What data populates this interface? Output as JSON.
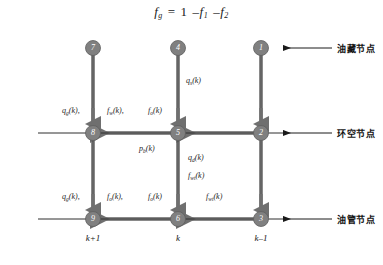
{
  "equation": {
    "lhs_base": "f",
    "lhs_sub": "g",
    "eq": "=",
    "one": "1",
    "minus1": "–",
    "t1_base": "f",
    "t1_sub": "1",
    "minus2": "–",
    "t2_base": "f",
    "t2_sub": "2",
    "full_text": "f_g = 1 – f_1 – f_2"
  },
  "colors": {
    "node_fill": "#808080",
    "node_stroke": "#5e5e5e",
    "node_text": "#ffffff",
    "pipe_thick": "#8a8a8a",
    "pipe_thin": "#3a3a3a",
    "annotation_arrow": "#1a1a1a",
    "text": "#1d1d1d",
    "background": "#ffffff"
  },
  "diagram": {
    "nodes": [
      {
        "id": "node-7",
        "label": "7",
        "x": 93,
        "y": 48,
        "row": "top",
        "col": "k+1"
      },
      {
        "id": "node-4",
        "label": "4",
        "x": 178,
        "y": 48,
        "row": "top",
        "col": "k"
      },
      {
        "id": "node-1",
        "label": "1",
        "x": 261,
        "y": 48,
        "row": "top",
        "col": "k-1"
      },
      {
        "id": "node-8",
        "label": "8",
        "x": 93,
        "y": 133,
        "row": "middle",
        "col": "k+1"
      },
      {
        "id": "node-5",
        "label": "5",
        "x": 178,
        "y": 133,
        "row": "middle",
        "col": "k"
      },
      {
        "id": "node-2",
        "label": "2",
        "x": 261,
        "y": 133,
        "row": "middle",
        "col": "k-1"
      },
      {
        "id": "node-9",
        "label": "9",
        "x": 93,
        "y": 219,
        "row": "bottom",
        "col": "k+1"
      },
      {
        "id": "node-6",
        "label": "6",
        "x": 178,
        "y": 219,
        "row": "bottom",
        "col": "k"
      },
      {
        "id": "node-3",
        "label": "3",
        "x": 261,
        "y": 219,
        "row": "bottom",
        "col": "k-1"
      }
    ],
    "column_labels": [
      {
        "id": "col-kp1",
        "text": "k+1",
        "x": 93,
        "y": 238
      },
      {
        "id": "col-k",
        "text": "k",
        "x": 178,
        "y": 238
      },
      {
        "id": "col-km1",
        "text": "k–1",
        "x": 261,
        "y": 238
      }
    ],
    "flow_labels": [
      {
        "id": "q-s-k-top",
        "base": "q",
        "sub": "s",
        "suffix": "(k)",
        "x": 186,
        "y": 83,
        "text": "q_s(k)"
      },
      {
        "id": "q-g-k-mid",
        "base": "q",
        "sub": "g",
        "suffix": "(k),",
        "x": 62,
        "y": 112,
        "text": "q_g(k),"
      },
      {
        "id": "f-w-k-mid",
        "base": "f",
        "sub": "w",
        "suffix": "(k),",
        "x": 107,
        "y": 112,
        "text": "f_w(k),"
      },
      {
        "id": "f-o-k-mid",
        "base": "f",
        "sub": "o",
        "suffix": "(k)",
        "x": 148,
        "y": 112,
        "text": "f_o(k)"
      },
      {
        "id": "p-b-k",
        "base": "p",
        "sub": "b",
        "suffix": "(k)",
        "x": 139,
        "y": 148,
        "text": "p_b(k)"
      },
      {
        "id": "q-d-k",
        "base": "q",
        "sub": "d",
        "suffix": "(k)",
        "x": 188,
        "y": 158,
        "text": "q_d(k)"
      },
      {
        "id": "f-wt-k",
        "base": "f",
        "sub": "wt",
        "suffix": "(k)",
        "x": 188,
        "y": 176,
        "text": "f_wt(k)"
      },
      {
        "id": "q-g-k-bot",
        "base": "q",
        "sub": "g",
        "suffix": "(k),",
        "x": 62,
        "y": 198,
        "text": "q_g(k),"
      },
      {
        "id": "f-o-k-bot",
        "base": "f",
        "sub": "o",
        "suffix": "(k),",
        "x": 107,
        "y": 198,
        "text": "f_o(k),"
      },
      {
        "id": "f-o2-k-bot",
        "base": "f",
        "sub": "o",
        "suffix": "(k)",
        "x": 148,
        "y": 198,
        "text": "f_o(k)"
      },
      {
        "id": "f-wt-k-bot",
        "base": "f",
        "sub": "wt",
        "suffix": "(k)",
        "x": 206,
        "y": 198,
        "text": "f_wt(k)"
      }
    ],
    "annotations": [
      {
        "id": "ann-reservoir",
        "text": "油藏节点",
        "arrow_y": 48,
        "text_x": 337,
        "text_y": 43,
        "arrow_x1": 332,
        "arrow_x2": 283
      },
      {
        "id": "ann-annulus",
        "text": "环空节点",
        "arrow_y": 133,
        "text_x": 337,
        "text_y": 128,
        "arrow_x1": 332,
        "arrow_x2": 283
      },
      {
        "id": "ann-tubing",
        "text": "油管节点",
        "arrow_y": 219,
        "text_x": 337,
        "text_y": 214,
        "arrow_x1": 332,
        "arrow_x2": 283
      }
    ]
  }
}
